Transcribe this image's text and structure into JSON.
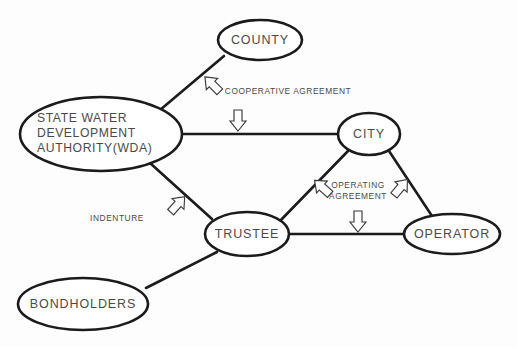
{
  "diagram": {
    "background_color": "#fdfdfd",
    "line_color": "#1b1b1b",
    "text_color": "#4a4a4a",
    "nodes": [
      {
        "id": "county",
        "label": "COUNTY",
        "lines": [
          "COUNTY"
        ],
        "cx": 260,
        "cy": 40,
        "rx": 42,
        "ry": 20
      },
      {
        "id": "wda",
        "label": "STATE WATER DEVELOPMENT AUTHORITY(WDA)",
        "lines": [
          "STATE  WATER",
          "DEVELOPMENT",
          "AUTHORITY(WDA)"
        ],
        "cx": 101,
        "cy": 134,
        "rx": 81,
        "ry": 37
      },
      {
        "id": "city",
        "label": "CITY",
        "lines": [
          "CITY"
        ],
        "cx": 369,
        "cy": 134,
        "rx": 31,
        "ry": 21
      },
      {
        "id": "trustee",
        "label": "TRUSTEE",
        "lines": [
          "TRUSTEE"
        ],
        "cx": 247,
        "cy": 234,
        "rx": 42,
        "ry": 22
      },
      {
        "id": "operator",
        "label": "OPERATOR",
        "lines": [
          "OPERATOR"
        ],
        "cx": 452,
        "cy": 234,
        "rx": 48,
        "ry": 20
      },
      {
        "id": "bondholders",
        "label": "BONDHOLDERS",
        "lines": [
          "BONDHOLDERS"
        ],
        "cx": 83,
        "cy": 304,
        "rx": 65,
        "ry": 26
      }
    ],
    "edges": [
      {
        "id": "county-wda",
        "from": "COUNTY",
        "to": "STATE WATER DEVELOPMENT AUTHORITY(WDA)",
        "x1": 224,
        "y1": 56,
        "x2": 160,
        "y2": 110
      },
      {
        "id": "wda-city",
        "from": "STATE WATER DEVELOPMENT AUTHORITY(WDA)",
        "to": "CITY",
        "x1": 182,
        "y1": 134,
        "x2": 339,
        "y2": 134
      },
      {
        "id": "wda-trustee",
        "from": "STATE WATER DEVELOPMENT AUTHORITY(WDA)",
        "to": "TRUSTEE",
        "x1": 150,
        "y1": 163,
        "x2": 212,
        "y2": 219
      },
      {
        "id": "city-trustee",
        "from": "CITY",
        "to": "TRUSTEE",
        "x1": 348,
        "y1": 151,
        "x2": 279,
        "y2": 222
      },
      {
        "id": "city-operator",
        "from": "CITY",
        "to": "OPERATOR",
        "x1": 389,
        "y1": 151,
        "x2": 434,
        "y2": 219
      },
      {
        "id": "trustee-operator",
        "from": "TRUSTEE",
        "to": "OPERATOR",
        "x1": 289,
        "y1": 234,
        "x2": 404,
        "y2": 234
      },
      {
        "id": "trustee-bondholders",
        "from": "TRUSTEE",
        "to": "BONDHOLDERS",
        "x1": 217,
        "y1": 252,
        "x2": 146,
        "y2": 288
      }
    ],
    "annotations": [
      {
        "id": "cooperative-agreement",
        "text": "COOPERATIVE  AGREEMENT",
        "lines": [
          "COOPERATIVE  AGREEMENT"
        ],
        "text_x": 288,
        "text_y": 92,
        "arrows": [
          {
            "id": "coop-arrow-up-left",
            "direction": "up-left",
            "x": 212,
            "y": 84,
            "target_edge": "county-wda"
          },
          {
            "id": "coop-arrow-down",
            "direction": "down",
            "x": 238,
            "y": 120,
            "target_edge": "wda-city"
          }
        ]
      },
      {
        "id": "indenture",
        "text": "INDENTURE",
        "lines": [
          "INDENTURE"
        ],
        "text_x": 117,
        "text_y": 219,
        "arrows": [
          {
            "id": "indenture-arrow-up-right",
            "direction": "up-right",
            "x": 178,
            "y": 204,
            "target_edge": "wda-trustee"
          }
        ]
      },
      {
        "id": "operating-agreement",
        "text": "OPERATING AGREEMENT",
        "lines": [
          "OPERATING",
          "AGREEMENT"
        ],
        "text_x": 358,
        "text_y": 190,
        "arrows": [
          {
            "id": "oper-arrow-up-left",
            "direction": "up-left",
            "x": 322,
            "y": 187,
            "target_edge": "city-trustee"
          },
          {
            "id": "oper-arrow-up-right",
            "direction": "up-right",
            "x": 401,
            "y": 187,
            "target_edge": "city-operator"
          },
          {
            "id": "oper-arrow-down",
            "direction": "down",
            "x": 358,
            "y": 221,
            "target_edge": "trustee-operator"
          }
        ]
      }
    ]
  }
}
